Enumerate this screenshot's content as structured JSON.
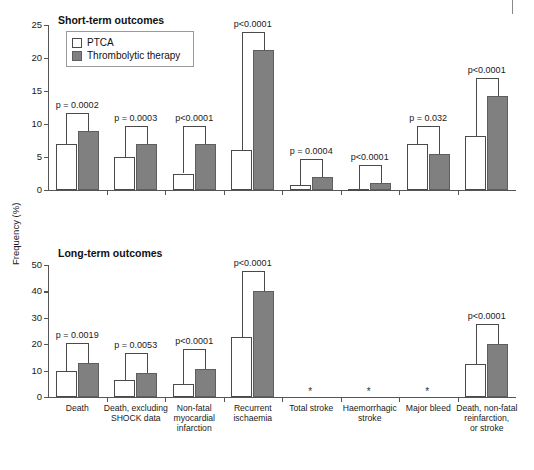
{
  "figure": {
    "y_axis_caption": "Frequency (%)",
    "colors": {
      "ptca": "#ffffff",
      "thrombolytic": "#808080",
      "axis": "#555555",
      "text": "#1a1a1a"
    },
    "legend": {
      "items": [
        {
          "key": "ptca",
          "label": "PTCA"
        },
        {
          "key": "thrombolytic",
          "label": "Thrombolytic therapy"
        }
      ]
    },
    "categories": [
      "Death",
      "Death, excluding SHOCK data",
      "Non-fatal myocardial infarction",
      "Recurrent ischaemia",
      "Total stroke",
      "Haemorrhagic stroke",
      "Major bleed",
      "Death, non-fatal reinfarction, or stroke"
    ],
    "category_label_lines": [
      [
        "Death"
      ],
      [
        "Death, excluding",
        "SHOCK data"
      ],
      [
        "Non-fatal",
        "myocardial",
        "infarction"
      ],
      [
        "Recurrent",
        "ischaemia"
      ],
      [
        "Total stroke"
      ],
      [
        "Haemorrhagic",
        "stroke"
      ],
      [
        "Major bleed"
      ],
      [
        "Death, non-fatal",
        "reinfarction,",
        "or stroke"
      ]
    ]
  },
  "chart_data": [
    {
      "type": "bar",
      "title": "Short-term outcomes",
      "xlabel": "",
      "ylabel": "Frequency (%)",
      "ylim": [
        0,
        25
      ],
      "yticks": [
        0,
        5,
        10,
        15,
        20,
        25
      ],
      "grid": false,
      "legend_position": "upper-left-inset",
      "categories": [
        "Death",
        "Death, excluding SHOCK data",
        "Non-fatal myocardial infarction",
        "Recurrent ischaemia",
        "Total stroke",
        "Haemorrhagic stroke",
        "Major bleed",
        "Death, non-fatal reinfarction, or stroke"
      ],
      "series": [
        {
          "name": "PTCA",
          "values": [
            7.0,
            5.0,
            2.5,
            6.0,
            0.7,
            0.05,
            7.0,
            8.2
          ]
        },
        {
          "name": "Thrombolytic therapy",
          "values": [
            9.0,
            7.0,
            7.0,
            21.2,
            2.0,
            1.1,
            5.5,
            14.2
          ]
        }
      ],
      "annotations": [
        {
          "category": "Death",
          "text": "p = 0.0002"
        },
        {
          "category": "Death, excluding SHOCK data",
          "text": "p = 0.0003"
        },
        {
          "category": "Non-fatal myocardial infarction",
          "text": "p<0.0001"
        },
        {
          "category": "Recurrent ischaemia",
          "text": "p<0.0001"
        },
        {
          "category": "Total stroke",
          "text": "p = 0.0004"
        },
        {
          "category": "Haemorrhagic stroke",
          "text": "p<0.0001"
        },
        {
          "category": "Major bleed",
          "text": "p = 0.032"
        },
        {
          "category": "Death, non-fatal reinfarction, or stroke",
          "text": "p<0.0001"
        }
      ]
    },
    {
      "type": "bar",
      "title": "Long-term outcomes",
      "xlabel": "",
      "ylabel": "Frequency (%)",
      "ylim": [
        0,
        50
      ],
      "yticks": [
        0,
        10,
        20,
        30,
        40,
        50
      ],
      "grid": false,
      "legend_position": "none",
      "categories": [
        "Death",
        "Death, excluding SHOCK data",
        "Non-fatal myocardial infarction",
        "Recurrent ischaemia",
        "Total stroke",
        "Haemorrhagic stroke",
        "Major bleed",
        "Death, non-fatal reinfarction, or stroke"
      ],
      "series": [
        {
          "name": "PTCA",
          "values": [
            10.0,
            6.5,
            5.0,
            22.6,
            null,
            null,
            null,
            12.5
          ]
        },
        {
          "name": "Thrombolytic therapy",
          "values": [
            13.0,
            9.0,
            10.5,
            40.0,
            null,
            null,
            null,
            20.0
          ]
        }
      ],
      "annotations": [
        {
          "category": "Death",
          "text": "p = 0.0019"
        },
        {
          "category": "Death, excluding SHOCK data",
          "text": "p = 0.0053"
        },
        {
          "category": "Non-fatal myocardial infarction",
          "text": "p<0.0001"
        },
        {
          "category": "Recurrent ischaemia",
          "text": "p<0.0001"
        },
        {
          "category": "Death, non-fatal reinfarction, or stroke",
          "text": "p<0.0001"
        }
      ],
      "no_data_markers": [
        {
          "category": "Total stroke",
          "symbol": "*"
        },
        {
          "category": "Haemorrhagic stroke",
          "symbol": "*"
        },
        {
          "category": "Major bleed",
          "symbol": "*"
        }
      ]
    }
  ]
}
